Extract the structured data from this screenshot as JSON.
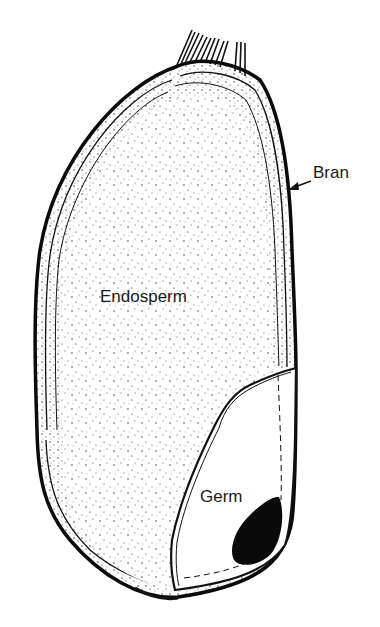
{
  "figure": {
    "type": "cross-section illustration",
    "labels": {
      "endosperm": "Endosperm",
      "germ": "Germ",
      "bran": "Bran"
    },
    "colors": {
      "ink": "#111111",
      "background": "#ffffff",
      "label_text": "#1a1a1a"
    },
    "caption_partial": "(clipped caption text at bottom edge, illegible)"
  }
}
